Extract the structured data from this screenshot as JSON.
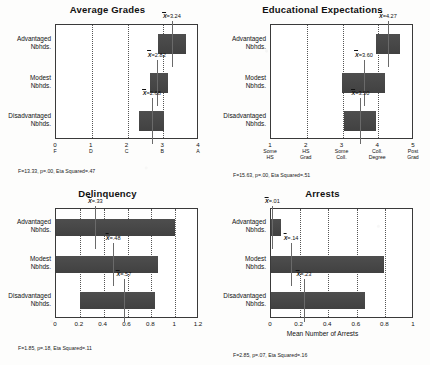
{
  "figure": {
    "categories": [
      "Advantaged Nbhds.",
      "Modest Nbhds.",
      "Disadvantaged Nbhds."
    ],
    "mean_prefix": "X"
  },
  "panels": [
    {
      "id": "average-grades",
      "title": "Average Grades",
      "stats": "F=13.33, p=.00, Eta Squared=.47",
      "xlabel": "",
      "xlim": [
        0,
        4
      ],
      "ticks": [
        {
          "v": 0,
          "label": "0",
          "sub": "F"
        },
        {
          "v": 1,
          "label": "1",
          "sub": "D"
        },
        {
          "v": 2,
          "label": "2",
          "sub": "C"
        },
        {
          "v": 3,
          "label": "3",
          "sub": "B"
        },
        {
          "v": 4,
          "label": "4",
          "sub": "A"
        }
      ],
      "gridlines": [
        1,
        2,
        3
      ],
      "bars": [
        {
          "cat": "Advantaged Nbhds.",
          "start": 2.85,
          "end": 3.65,
          "mean": 3.24,
          "mean_label": "=3.24"
        },
        {
          "cat": "Modest Nbhds.",
          "start": 2.62,
          "end": 3.12,
          "mean": 2.82,
          "mean_label": "=2.82"
        },
        {
          "cat": "Disadvantaged Nbhds.",
          "start": 2.33,
          "end": 3.03,
          "mean": 2.68,
          "mean_label": "=2.68"
        }
      ]
    },
    {
      "id": "educational-expectations",
      "title": "Educational Expectations",
      "stats": "F=15.63, p=.00, Eta Squared=.51",
      "xlabel": "",
      "xlim": [
        1,
        5
      ],
      "ticks": [
        {
          "v": 1,
          "label": "1",
          "sub": "Some\nHS"
        },
        {
          "v": 2,
          "label": "2",
          "sub": "HS\nGrad"
        },
        {
          "v": 3,
          "label": "3",
          "sub": "Some\nColl."
        },
        {
          "v": 4,
          "label": "4",
          "sub": "Coll.\nDegree"
        },
        {
          "v": 5,
          "label": "5",
          "sub": "Post\nGrad"
        }
      ],
      "gridlines": [
        2,
        3,
        4
      ],
      "bars": [
        {
          "cat": "Advantaged Nbhds.",
          "start": 3.95,
          "end": 4.62,
          "mean": 4.27,
          "mean_label": "=4.27"
        },
        {
          "cat": "Modest Nbhds.",
          "start": 2.98,
          "end": 4.18,
          "mean": 3.6,
          "mean_label": "=3.60"
        },
        {
          "cat": "Disadvantaged Nbhds.",
          "start": 3.05,
          "end": 3.95,
          "mean": 3.5,
          "mean_label": "=3.50"
        }
      ]
    },
    {
      "id": "delinquency",
      "title": "Delinquency",
      "stats": "F=1.85, p=.18, Eta Squared=.11",
      "xlabel": "",
      "xlim": [
        0,
        1.2
      ],
      "ticks": [
        {
          "v": 0,
          "label": "0",
          "sub": ""
        },
        {
          "v": 0.2,
          "label": "0.2",
          "sub": ""
        },
        {
          "v": 0.4,
          "label": "0.4",
          "sub": ""
        },
        {
          "v": 0.6,
          "label": "0.6",
          "sub": ""
        },
        {
          "v": 0.8,
          "label": "0.8",
          "sub": ""
        },
        {
          "v": 1.0,
          "label": "1",
          "sub": ""
        },
        {
          "v": 1.2,
          "label": "1.2",
          "sub": ""
        }
      ],
      "gridlines": [
        0.2,
        0.4,
        0.6,
        0.8,
        1.0
      ],
      "bars": [
        {
          "cat": "Advantaged Nbhds.",
          "start": 0,
          "end": 1.0,
          "mean": 0.33,
          "mean_label": "=.33"
        },
        {
          "cat": "Modest Nbhds.",
          "start": 0,
          "end": 0.86,
          "mean": 0.48,
          "mean_label": "=.48"
        },
        {
          "cat": "Disadvantaged Nbhds.",
          "start": 0.2,
          "end": 0.83,
          "mean": 0.57,
          "mean_label": "=.57"
        }
      ]
    },
    {
      "id": "arrests",
      "title": "Arrests",
      "stats": "F=2.85, p=.07, Eta Squared=.16",
      "xlabel": "Mean Number of Arrests",
      "xlim": [
        0,
        1
      ],
      "ticks": [
        {
          "v": 0,
          "label": "0",
          "sub": ""
        },
        {
          "v": 0.2,
          "label": "0.2",
          "sub": ""
        },
        {
          "v": 0.4,
          "label": "0.4",
          "sub": ""
        },
        {
          "v": 0.6,
          "label": "0.6",
          "sub": ""
        },
        {
          "v": 0.8,
          "label": "0.8",
          "sub": ""
        },
        {
          "v": 1.0,
          "label": "1",
          "sub": ""
        }
      ],
      "gridlines": [
        0.2,
        0.4,
        0.6,
        0.8
      ],
      "bars": [
        {
          "cat": "Advantaged Nbhds.",
          "start": 0,
          "end": 0.07,
          "mean": 0.01,
          "mean_label": "=.01"
        },
        {
          "cat": "Modest Nbhds.",
          "start": 0,
          "end": 0.79,
          "mean": 0.14,
          "mean_label": "=.14"
        },
        {
          "cat": "Disadvantaged Nbhds.",
          "start": 0,
          "end": 0.66,
          "mean": 0.23,
          "mean_label": "=.23"
        }
      ]
    }
  ],
  "chart_data": {
    "type": "bar",
    "orientation": "horizontal",
    "categories": [
      "Advantaged Nbhds.",
      "Modest Nbhds.",
      "Disadvantaged Nbhds."
    ],
    "panels": [
      {
        "title": "Average Grades",
        "xlabel": "",
        "ylabel": "",
        "xlim": [
          0,
          4
        ],
        "xtick_labels": [
          "0 F",
          "1 D",
          "2 C",
          "3 B",
          "4 A"
        ],
        "grid": true,
        "means": [
          3.24,
          2.82,
          2.68
        ],
        "bar_ranges": [
          [
            2.85,
            3.65
          ],
          [
            2.62,
            3.12
          ],
          [
            2.33,
            3.03
          ]
        ],
        "annotation": "F=13.33, p=.00, Eta Squared=.47"
      },
      {
        "title": "Educational Expectations",
        "xlabel": "",
        "ylabel": "",
        "xlim": [
          1,
          5
        ],
        "xtick_labels": [
          "1 Some HS",
          "2 HS Grad",
          "3 Some Coll.",
          "4 Coll. Degree",
          "5 Post Grad"
        ],
        "grid": true,
        "means": [
          4.27,
          3.6,
          3.5
        ],
        "bar_ranges": [
          [
            3.95,
            4.62
          ],
          [
            2.98,
            4.18
          ],
          [
            3.05,
            3.95
          ]
        ],
        "annotation": "F=15.63, p=.00, Eta Squared=.51"
      },
      {
        "title": "Delinquency",
        "xlabel": "",
        "ylabel": "",
        "xlim": [
          0,
          1.2
        ],
        "xtick_labels": [
          "0",
          "0.2",
          "0.4",
          "0.6",
          "0.8",
          "1",
          "1.2"
        ],
        "grid": true,
        "means": [
          0.33,
          0.48,
          0.57
        ],
        "bar_ranges": [
          [
            0,
            1.0
          ],
          [
            0,
            0.86
          ],
          [
            0.2,
            0.83
          ]
        ],
        "annotation": "F=1.85, p=.18, Eta Squared=.11"
      },
      {
        "title": "Arrests",
        "xlabel": "Mean Number of Arrests",
        "ylabel": "",
        "xlim": [
          0,
          1
        ],
        "xtick_labels": [
          "0",
          "0.2",
          "0.4",
          "0.6",
          "0.8",
          "1"
        ],
        "grid": true,
        "means": [
          0.01,
          0.14,
          0.23
        ],
        "bar_ranges": [
          [
            0,
            0.07
          ],
          [
            0,
            0.79
          ],
          [
            0,
            0.66
          ]
        ],
        "annotation": "F=2.85, p=.07, Eta Squared=.16"
      }
    ]
  }
}
